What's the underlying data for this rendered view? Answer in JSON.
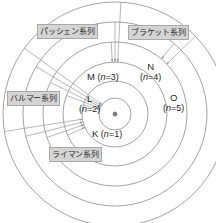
{
  "diagram": {
    "background_color": "#ffffff",
    "orbit_stroke_color": "#8d8d8d",
    "label_box_color": "#d4d4d4",
    "label_text_color": "#2b2b2b",
    "nucleus": {
      "name": "nucleus",
      "symbol": "·",
      "cx": 115,
      "cy": 114,
      "r": 2.2
    },
    "shells": [
      {
        "letter": "K",
        "n_text": "(n=1)",
        "n": 1,
        "radius": 16
      },
      {
        "letter": "L",
        "n_text": "(n=2)",
        "n": 2,
        "radius": 33
      },
      {
        "letter": "M",
        "n_text": "(n=3)",
        "n": 3,
        "radius": 52
      },
      {
        "letter": "N",
        "n_text": "(n=4)",
        "n": 4,
        "radius": 72
      },
      {
        "letter": "O",
        "n_text": "(n=5)",
        "n": 5,
        "radius": 92
      },
      {
        "letter": "",
        "n_text": "",
        "n": 6,
        "radius": 112
      }
    ],
    "shell_labels": [
      {
        "id": "shell-label-k",
        "letter": "K",
        "n_text": "(n=1)",
        "layout": "inline",
        "x": 92,
        "y": 129
      },
      {
        "id": "shell-label-l",
        "letter": "L",
        "n_text": "(n=2)",
        "layout": "stacked",
        "x": 79,
        "y": 94
      },
      {
        "id": "shell-label-m",
        "letter": "M",
        "n_text": "(n=3)",
        "layout": "inline",
        "x": 87,
        "y": 72
      },
      {
        "id": "shell-label-n",
        "letter": "N",
        "n_text": "(n=4)",
        "layout": "stacked",
        "x": 140,
        "y": 62
      },
      {
        "id": "shell-label-o",
        "letter": "O",
        "n_text": "(n=5)",
        "layout": "stacked",
        "x": 163,
        "y": 93
      }
    ],
    "series_labels": [
      {
        "id": "series-paschen",
        "text": "パッシェン系列",
        "romaji_name": "paschen",
        "x": 37,
        "y": 24
      },
      {
        "id": "series-brackett",
        "text": "ブラケット系列",
        "romaji_name": "brackett",
        "x": 128,
        "y": 25
      },
      {
        "id": "series-balmer",
        "text": "バルマー系列",
        "romaji_name": "balmer",
        "x": 7,
        "y": 91
      },
      {
        "id": "series-lyman",
        "text": "ライマン系列",
        "romaji_name": "lyman",
        "x": 49,
        "y": 147
      }
    ],
    "transitions": [
      {
        "series": "lyman",
        "from_n": 2,
        "to_n": 1,
        "angle_deg": 196
      },
      {
        "series": "lyman",
        "from_n": 3,
        "to_n": 1,
        "angle_deg": 201
      },
      {
        "series": "lyman",
        "from_n": 4,
        "to_n": 1,
        "angle_deg": 206
      },
      {
        "series": "lyman",
        "from_n": 5,
        "to_n": 1,
        "angle_deg": 211
      },
      {
        "series": "lyman",
        "from_n": 6,
        "to_n": 1,
        "angle_deg": 216
      },
      {
        "series": "balmer",
        "from_n": 3,
        "to_n": 2,
        "angle_deg": 156
      },
      {
        "series": "balmer",
        "from_n": 4,
        "to_n": 2,
        "angle_deg": 161
      },
      {
        "series": "balmer",
        "from_n": 5,
        "to_n": 2,
        "angle_deg": 166
      },
      {
        "series": "balmer",
        "from_n": 6,
        "to_n": 2,
        "angle_deg": 171
      },
      {
        "series": "paschen",
        "from_n": 4,
        "to_n": 3,
        "angle_deg": 267
      },
      {
        "series": "paschen",
        "from_n": 5,
        "to_n": 3,
        "angle_deg": 270
      },
      {
        "series": "paschen",
        "from_n": 6,
        "to_n": 3,
        "angle_deg": 273
      },
      {
        "series": "brackett",
        "from_n": 5,
        "to_n": 4,
        "angle_deg": 310
      },
      {
        "series": "brackett",
        "from_n": 6,
        "to_n": 4,
        "angle_deg": 316
      }
    ]
  }
}
